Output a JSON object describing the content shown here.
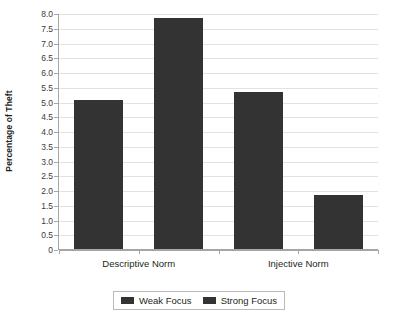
{
  "chart_data": {
    "type": "bar",
    "title": "",
    "subtitle": "",
    "xlabel": "",
    "ylabel": "Percentage of Theft",
    "categories": [
      "Descriptive Norm",
      "Injective Norm"
    ],
    "series": [
      {
        "name": "Weak Focus",
        "color": "#333333",
        "values": [
          5.1,
          5.35
        ]
      },
      {
        "name": "Strong Focus",
        "color": "#333333",
        "values": [
          7.88,
          1.87
        ]
      }
    ],
    "ylim": [
      0,
      8.0
    ],
    "ytick_step": 0.5,
    "ytick_labels": [
      "8.0",
      "7.5",
      "7.0",
      "6.5",
      "6.0",
      "5.5",
      "5.0",
      "4.5",
      "4.0",
      "3.5",
      "3.0",
      "2.5",
      "2.0",
      "1.5",
      "1.0",
      "0.5",
      "0"
    ],
    "ytick_values": [
      8.0,
      7.5,
      7.0,
      6.5,
      6.0,
      5.5,
      5.0,
      4.5,
      4.0,
      3.5,
      3.0,
      2.5,
      2.0,
      1.5,
      1.0,
      0.5,
      0
    ],
    "grid": "horizontal",
    "legend_position": "bottom",
    "legend_entries": [
      "Weak Focus",
      "Strong Focus"
    ],
    "bar_color": "#333333",
    "gridline_color": "#e2e2e2",
    "axis_color": "#a6a6a6",
    "background_color": "#ffffff"
  }
}
